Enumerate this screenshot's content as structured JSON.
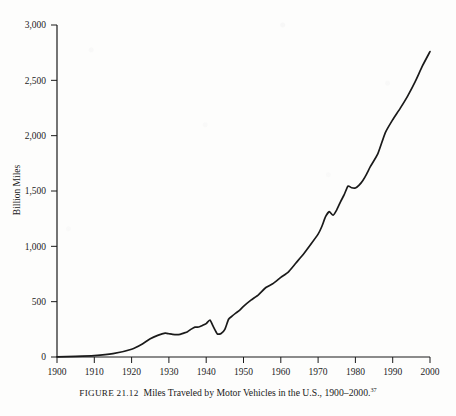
{
  "figure": {
    "label": "FIGURE 21.12",
    "caption_text": "Miles Traveled by Motor Vehicles in the U.S., 1900–2000.",
    "footnote_marker": "37"
  },
  "chart_data": {
    "type": "line",
    "title": "",
    "xlabel": "",
    "ylabel": "Billion Miles",
    "xlim": [
      1900,
      2000
    ],
    "ylim": [
      0,
      3000
    ],
    "grid": false,
    "legend": false,
    "line_color": "#1a1a1a",
    "xticks": [
      1900,
      1910,
      1920,
      1930,
      1940,
      1950,
      1960,
      1970,
      1980,
      1990,
      2000
    ],
    "xtick_labels": [
      "1900",
      "1910",
      "1920",
      "1930",
      "1940",
      "1950",
      "1960",
      "1970",
      "1980",
      "1990",
      "2000"
    ],
    "yticks": [
      0,
      500,
      1000,
      1500,
      2000,
      2500,
      3000
    ],
    "ytick_labels": [
      "0",
      "500",
      "1,000",
      "1,500",
      "2,000",
      "2,500",
      "3,000"
    ],
    "series": [
      {
        "name": "Miles Traveled by Motor Vehicles",
        "x": [
          1900,
          1905,
          1910,
          1915,
          1920,
          1923,
          1925,
          1927,
          1929,
          1930,
          1931,
          1932,
          1933,
          1934,
          1935,
          1936,
          1937,
          1938,
          1939,
          1940,
          1941,
          1942,
          1943,
          1944,
          1945,
          1946,
          1947,
          1948,
          1949,
          1950,
          1952,
          1954,
          1956,
          1958,
          1960,
          1962,
          1964,
          1966,
          1968,
          1970,
          1971,
          1972,
          1973,
          1974,
          1975,
          1976,
          1977,
          1978,
          1979,
          1980,
          1981,
          1982,
          1983,
          1984,
          1986,
          1988,
          1990,
          1992,
          1994,
          1996,
          1998,
          2000
        ],
        "y": [
          2,
          5,
          12,
          30,
          70,
          120,
          165,
          195,
          215,
          210,
          205,
          202,
          205,
          216,
          229,
          252,
          270,
          271,
          285,
          302,
          334,
          268,
          208,
          213,
          250,
          341,
          371,
          398,
          424,
          458,
          514,
          562,
          628,
          665,
          719,
          767,
          847,
          926,
          1016,
          1110,
          1179,
          1268,
          1313,
          1281,
          1330,
          1402,
          1467,
          1545,
          1529,
          1527,
          1553,
          1595,
          1653,
          1720,
          1835,
          2026,
          2144,
          2247,
          2358,
          2486,
          2632,
          2760
        ]
      }
    ],
    "annotations": []
  }
}
